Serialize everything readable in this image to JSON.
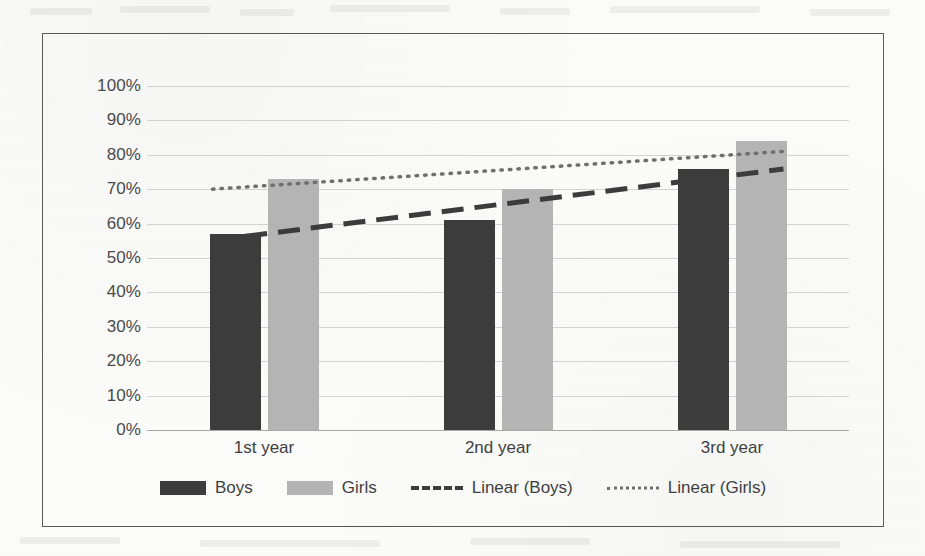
{
  "chart_data": {
    "type": "bar",
    "title": "",
    "subtitle": "",
    "xlabel": "",
    "ylabel": "",
    "categories": [
      "1st year",
      "2nd year",
      "3rd year"
    ],
    "series": [
      {
        "name": "Boys",
        "values": [
          57,
          61,
          76
        ],
        "color": "#3c3c3c",
        "kind": "bar"
      },
      {
        "name": "Girls",
        "values": [
          73,
          70,
          84
        ],
        "color": "#b4b4b4",
        "kind": "bar"
      },
      {
        "name": "Linear (Boys)",
        "values": [
          57,
          66,
          74
        ],
        "color": "#3c3c3c",
        "kind": "trendline",
        "style": "dashed"
      },
      {
        "name": "Linear (Girls)",
        "values": [
          71,
          76,
          80
        ],
        "color": "#6f6f6f",
        "kind": "trendline",
        "style": "dotted"
      }
    ],
    "ylim": [
      0,
      100
    ],
    "ytick_labels": [
      "100%",
      "90%",
      "80%",
      "70%",
      "60%",
      "50%",
      "40%",
      "30%",
      "20%",
      "10%",
      "0%"
    ],
    "ytick_values": [
      100,
      90,
      80,
      70,
      60,
      50,
      40,
      30,
      20,
      10,
      0
    ],
    "grid": true,
    "grid_axis": "y",
    "legend_position": "bottom",
    "value_unit": "%",
    "annotations": []
  },
  "legend": {
    "items": [
      {
        "label": "Boys",
        "marker": "solid-swatch-dark"
      },
      {
        "label": "Girls",
        "marker": "solid-swatch-light"
      },
      {
        "label": "Linear (Boys)",
        "marker": "dashed-line"
      },
      {
        "label": "Linear (Girls)",
        "marker": "dotted-line"
      }
    ]
  },
  "colors": {
    "boys": "#3c3c3c",
    "girls": "#b4b4b4",
    "trend_boys": "#3c3c3c",
    "trend_girls": "#6f6f6f",
    "gridline": "#d2d2d2",
    "frame_border": "#595959",
    "page_background": "#fbfbfa",
    "text": "#3f3f3f"
  }
}
